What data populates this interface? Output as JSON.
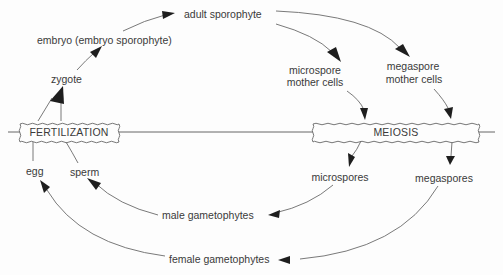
{
  "diagram": {
    "processes": {
      "fertilization": "FERTILIZATION",
      "meiosis": "MEIOSIS"
    },
    "stages": {
      "adult_sporophyte": "adult sporophyte",
      "embryo": "embryo (embryo sporophyte)",
      "zygote": "zygote",
      "microspore_mother_cells_1": "microspore",
      "microspore_mother_cells_2": "mother  cells",
      "megaspore_mother_cells_1": "megaspore",
      "megaspore_mother_cells_2": "mother  cells",
      "microspores": "microspores",
      "megaspores": "megaspores",
      "male_gametophytes": "male gametophytes",
      "female_gametophytes": "female gametophytes",
      "egg": "egg",
      "sperm": "sperm"
    },
    "edges": [
      {
        "from": "egg",
        "to": "fertilization"
      },
      {
        "from": "sperm",
        "to": "fertilization"
      },
      {
        "from": "fertilization",
        "to": "zygote"
      },
      {
        "from": "zygote",
        "to": "embryo"
      },
      {
        "from": "embryo",
        "to": "adult_sporophyte"
      },
      {
        "from": "adult_sporophyte",
        "to": "microspore_mother_cells"
      },
      {
        "from": "adult_sporophyte",
        "to": "megaspore_mother_cells"
      },
      {
        "from": "microspore_mother_cells",
        "to": "meiosis"
      },
      {
        "from": "megaspore_mother_cells",
        "to": "meiosis"
      },
      {
        "from": "meiosis",
        "to": "microspores"
      },
      {
        "from": "meiosis",
        "to": "megaspores"
      },
      {
        "from": "microspores",
        "to": "male_gametophytes"
      },
      {
        "from": "megaspores",
        "to": "female_gametophytes"
      },
      {
        "from": "male_gametophytes",
        "to": "sperm"
      },
      {
        "from": "female_gametophytes",
        "to": "egg"
      }
    ]
  }
}
